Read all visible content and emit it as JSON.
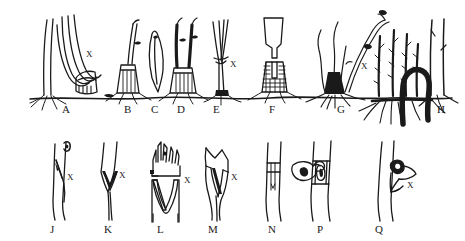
{
  "figure": {
    "kind": "scientific-line-drawing",
    "background_color": "#ffffff",
    "ink_color": "#1a1a1a",
    "ground_line_label": "ground-line"
  },
  "rows": {
    "top": {
      "name": "whole-plant-forms-row",
      "baseline_y": 100,
      "panels": [
        {
          "id": "A",
          "label": "A",
          "label_x": 66,
          "label_y": 110,
          "description": "leaning tree with arched stem bending down to a cut stump",
          "x_marker": {
            "text": "X",
            "x": 88,
            "y": 54
          }
        },
        {
          "id": "B",
          "label": "B",
          "label_x": 128,
          "label_y": 110,
          "description": "cut stump with single upright sprout",
          "x_marker": null
        },
        {
          "id": "C",
          "label": "C",
          "label_x": 155,
          "label_y": 110,
          "description": "detached tapered shoot fragment",
          "x_marker": null
        },
        {
          "id": "D",
          "label": "D",
          "label_x": 181,
          "label_y": 110,
          "description": "cut stump with two dark upright sprouts",
          "x_marker": null
        },
        {
          "id": "E",
          "label": "E",
          "label_x": 217,
          "label_y": 110,
          "description": "forked stem arising from ground level",
          "x_marker": {
            "text": "X",
            "x": 232,
            "y": 64
          }
        },
        {
          "id": "F",
          "label": "F",
          "label_x": 273,
          "label_y": 110,
          "description": "stippled stump with vertical slot and detached broken top",
          "x_marker": null
        },
        {
          "id": "G",
          "label": "G",
          "label_x": 341,
          "label_y": 110,
          "description": "rootstock with wavy sprouts and leaning shoot",
          "x_marker": {
            "text": "X",
            "x": 363,
            "y": 66
          }
        },
        {
          "id": "H",
          "label": "H",
          "label_x": 441,
          "label_y": 110,
          "description": "parent tree with bold underground rhizome bearing root suckers",
          "x_marker": null
        }
      ]
    },
    "bottom": {
      "name": "stem-detail-row",
      "panels": [
        {
          "id": "J",
          "label": "J",
          "label_x": 53,
          "label_y": 230,
          "description": "stem with small bud at top and narrow longitudinal crack",
          "x_marker": {
            "text": "X",
            "x": 69,
            "y": 177
          }
        },
        {
          "id": "K",
          "label": "K",
          "label_x": 108,
          "label_y": 230,
          "description": "stem with clean V-shaped notch break",
          "x_marker": {
            "text": "X",
            "x": 121,
            "y": 175
          }
        },
        {
          "id": "L",
          "label": "L",
          "label_x": 160,
          "label_y": 230,
          "description": "splintered break with ragged fibres above deep V notch",
          "x_marker": {
            "text": "X",
            "x": 177,
            "y": 180
          }
        },
        {
          "id": "M",
          "label": "M",
          "label_x": 212,
          "label_y": 230,
          "description": "jagged irregular split of stem",
          "x_marker": {
            "text": "X",
            "x": 233,
            "y": 177
          }
        },
        {
          "id": "N",
          "label": "N",
          "label_x": 272,
          "label_y": 230,
          "description": "stem with girdled band and detached bark disc alongside",
          "x_marker": null
        },
        {
          "id": "P",
          "label": "P",
          "label_x": 320,
          "label_y": 230,
          "description": "stem with banded scar enclosing oval wound",
          "x_marker": {
            "text": "X",
            "x": 343,
            "y": 176
          }
        },
        {
          "id": "Q",
          "label": "Q",
          "label_x": 378,
          "label_y": 230,
          "description": "stem with dark hooked bark flap",
          "x_marker": {
            "text": "X",
            "x": 409,
            "y": 185
          }
        }
      ]
    }
  }
}
